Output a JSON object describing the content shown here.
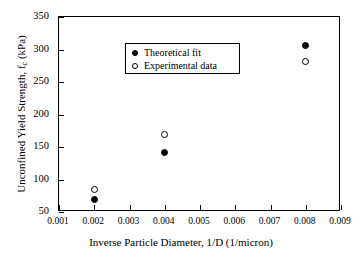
{
  "chart_data": {
    "type": "scatter",
    "title": "",
    "xlabel": "Inverse Particle Diameter, 1/D (1/micron)",
    "ylabel_text": "Unconfined Yield Strength, f",
    "ylabel_sub": "c",
    "ylabel_tail": " (kPa)",
    "xlim": [
      0.001,
      0.009
    ],
    "ylim": [
      50,
      350
    ],
    "grid": false,
    "legend_position": "upper left",
    "xticks": [
      0.001,
      0.002,
      0.003,
      0.004,
      0.005,
      0.006,
      0.007,
      0.008,
      0.009
    ],
    "xtick_labels": [
      "0.001",
      "0.002",
      "0.003",
      "0.004",
      "0.005",
      "0.006",
      "0.007",
      "0.008",
      "0.009"
    ],
    "yticks": [
      50,
      100,
      150,
      200,
      250,
      300,
      350
    ],
    "ytick_labels": [
      "50",
      "100",
      "150",
      "200",
      "250",
      "300",
      "350"
    ],
    "series": [
      {
        "name": "Theoretical fit",
        "marker": "filled-circle",
        "color": "#000000",
        "x": [
          0.002,
          0.004,
          0.008
        ],
        "y": [
          69,
          142,
          306
        ]
      },
      {
        "name": "Experimental data",
        "marker": "open-circle",
        "color": "#000000",
        "x": [
          0.002,
          0.004,
          0.008
        ],
        "y": [
          85,
          169,
          281
        ]
      }
    ]
  },
  "legend": {
    "items": [
      {
        "label": "Theoretical fit",
        "marker": "filled-circle"
      },
      {
        "label": "Experimental data",
        "marker": "open-circle"
      }
    ]
  },
  "colors": {
    "background": "#ffffff",
    "axis": "#000000",
    "marker": "#000000"
  }
}
